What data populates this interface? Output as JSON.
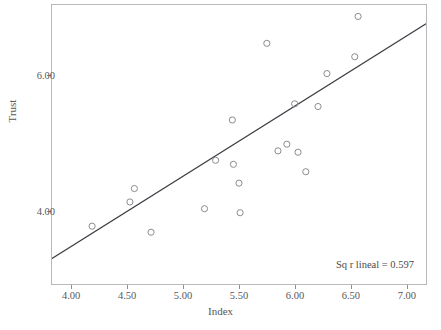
{
  "chart_data": {
    "type": "scatter",
    "title": "",
    "xlabel": "Index",
    "ylabel": "Trust",
    "xlim": [
      3.82,
      7.18
    ],
    "ylim": [
      2.9,
      7.05
    ],
    "grid": false,
    "legend": null,
    "x_ticks": [
      "4.00",
      "4.50",
      "5.00",
      "5.50",
      "6.00",
      "6.50",
      "7.00"
    ],
    "x_tick_values": [
      4.0,
      4.5,
      5.0,
      5.5,
      6.0,
      6.5,
      7.0
    ],
    "y_ticks": [
      "6.00",
      "4.00"
    ],
    "y_tick_values": [
      6.0,
      4.0
    ],
    "points": [
      {
        "x": 4.18,
        "y": 3.76
      },
      {
        "x": 4.52,
        "y": 4.12
      },
      {
        "x": 4.56,
        "y": 4.32
      },
      {
        "x": 4.71,
        "y": 3.67
      },
      {
        "x": 5.19,
        "y": 4.02
      },
      {
        "x": 5.29,
        "y": 4.74
      },
      {
        "x": 5.45,
        "y": 4.68
      },
      {
        "x": 5.44,
        "y": 5.34
      },
      {
        "x": 5.5,
        "y": 4.4
      },
      {
        "x": 5.51,
        "y": 3.96
      },
      {
        "x": 5.75,
        "y": 6.48
      },
      {
        "x": 5.85,
        "y": 4.88
      },
      {
        "x": 5.93,
        "y": 4.98
      },
      {
        "x": 6.0,
        "y": 5.58
      },
      {
        "x": 6.03,
        "y": 4.86
      },
      {
        "x": 6.1,
        "y": 4.57
      },
      {
        "x": 6.21,
        "y": 5.54
      },
      {
        "x": 6.29,
        "y": 6.03
      },
      {
        "x": 6.54,
        "y": 6.28
      },
      {
        "x": 6.57,
        "y": 6.88
      }
    ],
    "fit_line": {
      "label": "Sq r lineal = 0.597",
      "r_squared": 0.597,
      "x_start": 3.82,
      "y_start": 3.28,
      "x_end": 7.18,
      "y_end": 6.77,
      "color": "#3d3d44"
    },
    "marker": {
      "shape": "circle-open",
      "color": "#8a8a90",
      "radius": 3.1
    }
  }
}
